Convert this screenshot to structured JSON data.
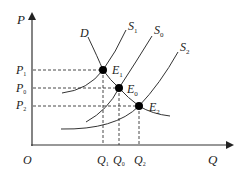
{
  "axes": {
    "y_label": "P",
    "x_label": "Q",
    "origin_label": "O"
  },
  "curves": {
    "demand": {
      "label": "D"
    },
    "supply": [
      {
        "label": "S",
        "sub": "1"
      },
      {
        "label": "S",
        "sub": "0"
      },
      {
        "label": "S",
        "sub": "2"
      }
    ]
  },
  "equilibria": [
    {
      "label": "E",
      "sub": "1"
    },
    {
      "label": "E",
      "sub": "0"
    },
    {
      "label": "E",
      "sub": "2"
    }
  ],
  "price_levels": [
    {
      "label": "P",
      "sub": "1"
    },
    {
      "label": "P",
      "sub": "0"
    },
    {
      "label": "P",
      "sub": "2"
    }
  ],
  "quantity_levels": [
    {
      "label": "Q",
      "sub": "1"
    },
    {
      "label": "Q",
      "sub": "0"
    },
    {
      "label": "Q",
      "sub": "2"
    }
  ],
  "colors": {
    "line": "#333333",
    "point": "#000000",
    "background": "#ffffff"
  }
}
